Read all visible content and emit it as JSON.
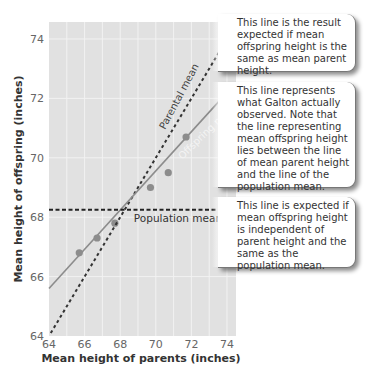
{
  "chart_data": {
    "type": "scatter",
    "title": "",
    "xlabel": "Mean height of parents (inches)",
    "ylabel": "Mean height of offspring (inches)",
    "xlim": [
      64,
      74.5
    ],
    "ylim": [
      64,
      74.5
    ],
    "x_ticks": [
      64,
      66,
      68,
      70,
      72,
      74
    ],
    "y_ticks": [
      64,
      66,
      68,
      70,
      72,
      74
    ],
    "grid": true,
    "series": [
      {
        "name": "Observed offspring means",
        "kind": "points",
        "color": "#8c8c8c",
        "x": [
          65.7,
          66.7,
          67.7,
          69.7,
          70.7,
          71.7
        ],
        "y": [
          66.8,
          67.3,
          67.8,
          69.0,
          69.5,
          70.7
        ]
      },
      {
        "name": "Parental mean",
        "kind": "dashed-line",
        "color": "#333333",
        "x": [
          64.1,
          74.3
        ],
        "y": [
          64.1,
          74.3
        ]
      },
      {
        "name": "Offspring mean",
        "kind": "solid-line",
        "color": "#8c8c8c",
        "x": [
          64.0,
          73.7
        ],
        "y": [
          65.6,
          72.0
        ]
      },
      {
        "name": "Population mean",
        "kind": "dashed-line",
        "color": "#222222",
        "x": [
          64.0,
          74.5
        ],
        "y": [
          68.25,
          68.25
        ]
      }
    ],
    "annotations": [
      {
        "text": "Parental mean",
        "target": "Parental mean"
      },
      {
        "text": "Offspring mean",
        "target": "Offspring mean"
      },
      {
        "text": "Population mean",
        "target": "Population mean"
      }
    ]
  },
  "labels": {
    "parental_mean": "Parental mean",
    "offspring_mean": "Offspring mean",
    "population_mean": "Population mean"
  },
  "callouts": [
    {
      "text": "This line is the result expected if mean offspring height is the same as mean parent height."
    },
    {
      "text": "This line represents what Galton actually observed. Note that the line representing mean offspring height lies between the line of mean parent height and the line of the population mean."
    },
    {
      "text": "This line is expected if mean offspring height is independent of parent height and the same as the population mean."
    }
  ],
  "colors": {
    "plot_bg": "#e1e1e1",
    "grid": "#f2f2f2",
    "point": "#8c8c8c",
    "dash": "#333333"
  }
}
